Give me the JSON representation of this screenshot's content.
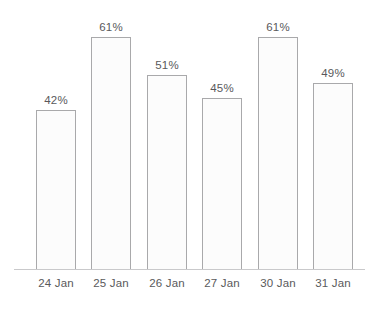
{
  "chart_data": {
    "type": "bar",
    "title": "",
    "subtitle": "",
    "xlabel": "",
    "ylabel": "",
    "categories": [
      "24 Jan",
      "25 Jan",
      "26 Jan",
      "27 Jan",
      "30 Jan",
      "31 Jan"
    ],
    "values": [
      42,
      61,
      51,
      45,
      61,
      49
    ],
    "value_labels": [
      "42%",
      "61%",
      "51%",
      "45%",
      "61%",
      "49%"
    ],
    "unit": "%",
    "ylim": [
      0,
      70
    ],
    "grid": false,
    "legend": null,
    "legend_position": "none",
    "annotations": [],
    "axis_line": true,
    "colors": {
      "bar_fill": "#fcfcfc",
      "bar_border": "#a9a9ab",
      "axis_line": "#c9c9cb",
      "text": "#59595b",
      "background": "#ffffff"
    }
  },
  "chart": {
    "bars": [
      {
        "category": "24 Jan",
        "value": 42,
        "label": "42%"
      },
      {
        "category": "25 Jan",
        "value": 61,
        "label": "61%"
      },
      {
        "category": "26 Jan",
        "value": 51,
        "label": "51%"
      },
      {
        "category": "27 Jan",
        "value": 45,
        "label": "45%"
      },
      {
        "category": "30 Jan",
        "value": 61,
        "label": "61%"
      },
      {
        "category": "31 Jan",
        "value": 49,
        "label": "49%"
      }
    ]
  }
}
